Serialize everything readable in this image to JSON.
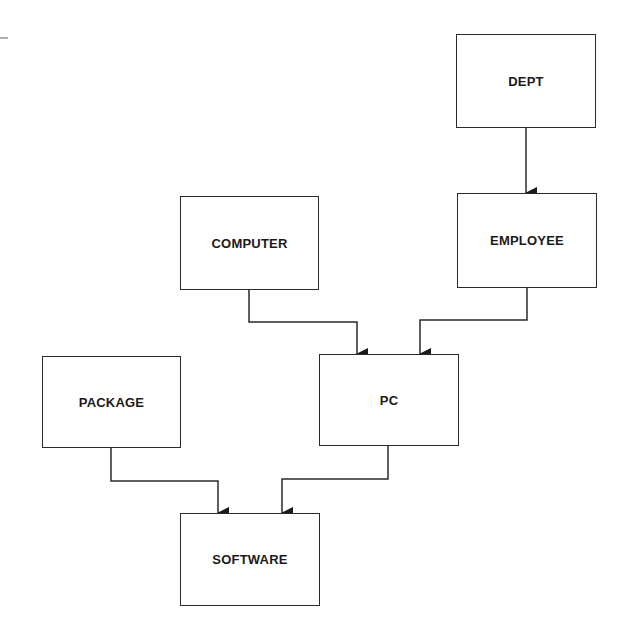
{
  "diagram": {
    "type": "entity-dependency-diagram",
    "nodes": [
      {
        "id": "dept",
        "label": "DEPT",
        "x": 456,
        "y": 34,
        "w": 140,
        "h": 94
      },
      {
        "id": "employee",
        "label": "EMPLOYEE",
        "x": 457,
        "y": 193,
        "w": 140,
        "h": 95
      },
      {
        "id": "computer",
        "label": "COMPUTER",
        "x": 180,
        "y": 196,
        "w": 139,
        "h": 94
      },
      {
        "id": "pc",
        "label": "PC",
        "x": 319,
        "y": 354,
        "w": 140,
        "h": 92
      },
      {
        "id": "package",
        "label": "PACKAGE",
        "x": 42,
        "y": 356,
        "w": 139,
        "h": 92
      },
      {
        "id": "software",
        "label": "SOFTWARE",
        "x": 180,
        "y": 513,
        "w": 140,
        "h": 93
      }
    ],
    "edges": [
      {
        "from": "dept",
        "to": "employee"
      },
      {
        "from": "computer",
        "to": "pc"
      },
      {
        "from": "employee",
        "to": "pc"
      },
      {
        "from": "package",
        "to": "software"
      },
      {
        "from": "pc",
        "to": "software"
      }
    ],
    "colors": {
      "line": "#2a2a2a",
      "background": "#ffffff"
    }
  }
}
